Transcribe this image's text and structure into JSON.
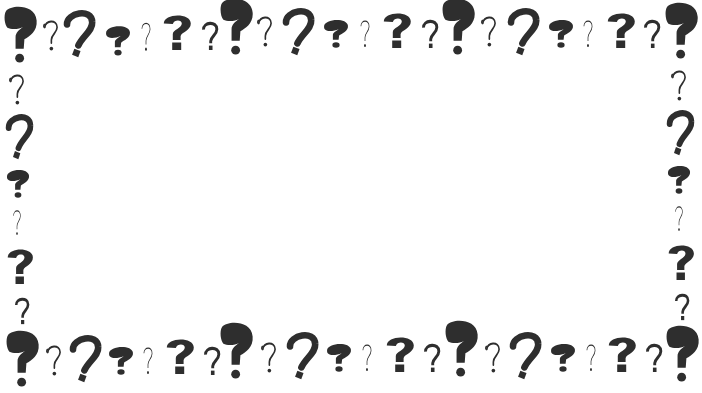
{
  "image": {
    "description": "Decorative border frame made of question marks in varied styles around an empty white center",
    "ink_color": "#2e2e2e",
    "background_color": "#ffffff",
    "glyph": "?"
  },
  "center_area": {
    "content": ""
  },
  "glyph_styles": [
    "blob",
    "thin",
    "curvy",
    "fat",
    "hair",
    "block",
    "medium"
  ],
  "top_row": [
    {
      "style": "blob",
      "x": 4,
      "y": 6,
      "w": 34,
      "h": 58
    },
    {
      "style": "thin",
      "x": 42,
      "y": 18,
      "w": 18,
      "h": 34
    },
    {
      "style": "curvy",
      "x": 64,
      "y": 10,
      "w": 30,
      "h": 48
    },
    {
      "style": "fat",
      "x": 105,
      "y": 22,
      "w": 26,
      "h": 36
    },
    {
      "style": "hair",
      "x": 140,
      "y": 20,
      "w": 12,
      "h": 32
    },
    {
      "style": "block",
      "x": 162,
      "y": 12,
      "w": 30,
      "h": 40
    },
    {
      "style": "medium",
      "x": 201,
      "y": 20,
      "w": 18,
      "h": 32
    },
    {
      "style": "blob",
      "x": 220,
      "y": -2,
      "w": 34,
      "h": 58
    },
    {
      "style": "thin",
      "x": 256,
      "y": 14,
      "w": 18,
      "h": 34
    },
    {
      "style": "curvy",
      "x": 283,
      "y": 8,
      "w": 30,
      "h": 48
    },
    {
      "style": "fat",
      "x": 323,
      "y": 16,
      "w": 26,
      "h": 34
    },
    {
      "style": "hair",
      "x": 359,
      "y": 18,
      "w": 12,
      "h": 30
    },
    {
      "style": "block",
      "x": 382,
      "y": 10,
      "w": 30,
      "h": 40
    },
    {
      "style": "medium",
      "x": 421,
      "y": 18,
      "w": 18,
      "h": 32
    },
    {
      "style": "blob",
      "x": 442,
      "y": -2,
      "w": 34,
      "h": 58
    },
    {
      "style": "thin",
      "x": 480,
      "y": 14,
      "w": 18,
      "h": 34
    },
    {
      "style": "curvy",
      "x": 508,
      "y": 8,
      "w": 30,
      "h": 48
    },
    {
      "style": "fat",
      "x": 548,
      "y": 16,
      "w": 26,
      "h": 34
    },
    {
      "style": "hair",
      "x": 582,
      "y": 18,
      "w": 12,
      "h": 30
    },
    {
      "style": "block",
      "x": 606,
      "y": 10,
      "w": 30,
      "h": 40
    },
    {
      "style": "medium",
      "x": 643,
      "y": 18,
      "w": 18,
      "h": 32
    },
    {
      "style": "blob",
      "x": 665,
      "y": 2,
      "w": 34,
      "h": 58
    }
  ],
  "bottom_row": [
    {
      "style": "blob",
      "x": 6,
      "y": 330,
      "w": 34,
      "h": 58
    },
    {
      "style": "thin",
      "x": 45,
      "y": 343,
      "w": 18,
      "h": 34
    },
    {
      "style": "curvy",
      "x": 70,
      "y": 335,
      "w": 30,
      "h": 48
    },
    {
      "style": "fat",
      "x": 108,
      "y": 343,
      "w": 26,
      "h": 34
    },
    {
      "style": "hair",
      "x": 142,
      "y": 345,
      "w": 12,
      "h": 30
    },
    {
      "style": "block",
      "x": 165,
      "y": 336,
      "w": 30,
      "h": 40
    },
    {
      "style": "medium",
      "x": 203,
      "y": 345,
      "w": 18,
      "h": 32
    },
    {
      "style": "blob",
      "x": 220,
      "y": 322,
      "w": 34,
      "h": 58
    },
    {
      "style": "thin",
      "x": 260,
      "y": 340,
      "w": 18,
      "h": 34
    },
    {
      "style": "curvy",
      "x": 287,
      "y": 332,
      "w": 30,
      "h": 48
    },
    {
      "style": "fat",
      "x": 326,
      "y": 340,
      "w": 26,
      "h": 34
    },
    {
      "style": "hair",
      "x": 361,
      "y": 342,
      "w": 12,
      "h": 30
    },
    {
      "style": "block",
      "x": 385,
      "y": 334,
      "w": 30,
      "h": 40
    },
    {
      "style": "medium",
      "x": 423,
      "y": 342,
      "w": 18,
      "h": 32
    },
    {
      "style": "blob",
      "x": 445,
      "y": 320,
      "w": 34,
      "h": 58
    },
    {
      "style": "thin",
      "x": 484,
      "y": 340,
      "w": 18,
      "h": 34
    },
    {
      "style": "curvy",
      "x": 510,
      "y": 332,
      "w": 30,
      "h": 48
    },
    {
      "style": "fat",
      "x": 550,
      "y": 340,
      "w": 26,
      "h": 34
    },
    {
      "style": "hair",
      "x": 585,
      "y": 342,
      "w": 12,
      "h": 30
    },
    {
      "style": "block",
      "x": 607,
      "y": 334,
      "w": 30,
      "h": 40
    },
    {
      "style": "medium",
      "x": 645,
      "y": 342,
      "w": 18,
      "h": 32
    },
    {
      "style": "blob",
      "x": 666,
      "y": 325,
      "w": 34,
      "h": 58
    }
  ],
  "left_column": [
    {
      "style": "thin",
      "x": 8,
      "y": 72,
      "w": 18,
      "h": 34
    },
    {
      "style": "curvy",
      "x": 6,
      "y": 114,
      "w": 26,
      "h": 46
    },
    {
      "style": "fat",
      "x": 6,
      "y": 166,
      "w": 24,
      "h": 34
    },
    {
      "style": "hair",
      "x": 12,
      "y": 208,
      "w": 10,
      "h": 28
    },
    {
      "style": "block",
      "x": 6,
      "y": 246,
      "w": 28,
      "h": 40
    },
    {
      "style": "medium",
      "x": 14,
      "y": 296,
      "w": 16,
      "h": 30
    }
  ],
  "right_column": [
    {
      "style": "thin",
      "x": 670,
      "y": 68,
      "w": 18,
      "h": 34
    },
    {
      "style": "curvy",
      "x": 667,
      "y": 110,
      "w": 26,
      "h": 46
    },
    {
      "style": "fat",
      "x": 667,
      "y": 162,
      "w": 24,
      "h": 34
    },
    {
      "style": "hair",
      "x": 674,
      "y": 204,
      "w": 10,
      "h": 28
    },
    {
      "style": "block",
      "x": 667,
      "y": 242,
      "w": 28,
      "h": 40
    },
    {
      "style": "medium",
      "x": 674,
      "y": 292,
      "w": 16,
      "h": 30
    }
  ]
}
